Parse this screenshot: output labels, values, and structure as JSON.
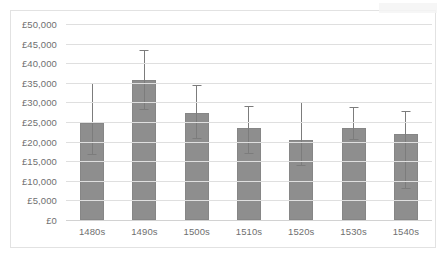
{
  "chart_data": {
    "type": "bar",
    "title": "",
    "xlabel": "",
    "ylabel": "",
    "categories": [
      "1480s",
      "1490s",
      "1500s",
      "1510s",
      "1520s",
      "1530s",
      "1540s"
    ],
    "values": [
      24700,
      35800,
      27400,
      23600,
      20300,
      23500,
      22000
    ],
    "error_high": [
      34900,
      43400,
      34500,
      29000,
      30000,
      28900,
      27800
    ],
    "error_low": [
      16500,
      28000,
      20600,
      16900,
      13900,
      20300,
      8000
    ],
    "ylim": [
      0,
      50000
    ],
    "ytick_values": [
      0,
      5000,
      10000,
      15000,
      20000,
      25000,
      30000,
      35000,
      40000,
      45000,
      50000
    ],
    "ytick_labels": [
      "£0",
      "£5,000",
      "£10,000",
      "£15,000",
      "£20,000",
      "£25,000",
      "£30,000",
      "£35,000",
      "£40,000",
      "£45,000",
      "£50,000"
    ],
    "grid": true,
    "legend": "none",
    "bar_color": "#8e8e8e",
    "error_bar_color": "#7c7c7c",
    "gridline_color": "#dfdfdf",
    "axis_text_color": "#6f6f6f"
  }
}
